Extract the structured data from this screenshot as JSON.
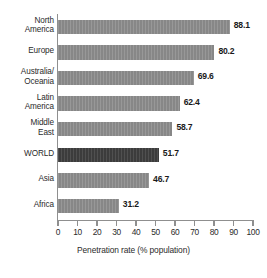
{
  "chart_data": {
    "type": "bar",
    "orientation": "horizontal",
    "title": "",
    "xlabel": "Penetration rate (% population)",
    "ylabel": "",
    "xlim": [
      0,
      100
    ],
    "xticks": [
      0,
      10,
      20,
      30,
      40,
      50,
      60,
      70,
      80,
      90,
      100
    ],
    "grid": false,
    "legend": null,
    "categories": [
      "North America",
      "Europe",
      "Australia/ Oceania",
      "Latin America",
      "Middle East",
      "WORLD",
      "Asia",
      "Africa"
    ],
    "values": [
      88.1,
      80.2,
      69.6,
      62.4,
      58.7,
      51.7,
      46.7,
      31.2
    ],
    "value_labels": [
      "88.1",
      "80.2",
      "69.6",
      "62.4",
      "58.7",
      "51.7",
      "46.7",
      "31.2"
    ],
    "highlight_category": "WORLD",
    "colors": {
      "bar": "#878787",
      "bar_highlight": "#3c3c3c",
      "axis": "#8f8f8f",
      "text": "#2b2b2b",
      "background": "#ffffff"
    },
    "bars": [
      {
        "label": "North America",
        "label_lines": [
          "North",
          "America"
        ],
        "value": 88.1,
        "value_label": "88.1",
        "highlight": false
      },
      {
        "label": "Europe",
        "label_lines": [
          "Europe"
        ],
        "value": 80.2,
        "value_label": "80.2",
        "highlight": false
      },
      {
        "label": "Australia/Oceania",
        "label_lines": [
          "Australia/",
          "Oceania"
        ],
        "value": 69.6,
        "value_label": "69.6",
        "highlight": false
      },
      {
        "label": "Latin America",
        "label_lines": [
          "Latin",
          "America"
        ],
        "value": 62.4,
        "value_label": "62.4",
        "highlight": false
      },
      {
        "label": "Middle East",
        "label_lines": [
          "Middle",
          "East"
        ],
        "value": 58.7,
        "value_label": "58.7",
        "highlight": false
      },
      {
        "label": "WORLD",
        "label_lines": [
          "WORLD"
        ],
        "value": 51.7,
        "value_label": "51.7",
        "highlight": true
      },
      {
        "label": "Asia",
        "label_lines": [
          "Asia"
        ],
        "value": 46.7,
        "value_label": "46.7",
        "highlight": false
      },
      {
        "label": "Africa",
        "label_lines": [
          "Africa"
        ],
        "value": 31.2,
        "value_label": "31.2",
        "highlight": false
      }
    ]
  }
}
